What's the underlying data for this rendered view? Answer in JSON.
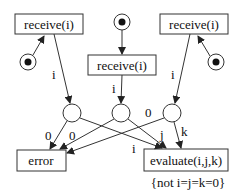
{
  "diagram": {
    "type": "petri-net",
    "transitions": {
      "receive_left": "receive(i)",
      "receive_center": "receive(i)",
      "receive_right": "receive(i)",
      "error": "error",
      "evaluate": "evaluate(i,j,k)"
    },
    "guard": "{not i=j=k=0}",
    "arc_labels": {
      "left_out": "i",
      "center_out": "i",
      "right_out": "i",
      "p1_to_error": "0",
      "p2_to_error": "0",
      "p3_to_error": "0",
      "p1_to_eval": "i",
      "p2_to_eval": "j",
      "p3_to_eval": "k"
    },
    "colors": {
      "stroke": "#333333",
      "text": "#111111",
      "background": "#ffffff"
    }
  }
}
